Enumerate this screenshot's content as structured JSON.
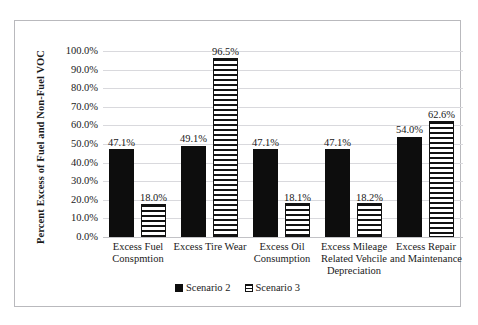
{
  "chart_data": {
    "type": "bar",
    "title": "",
    "xlabel": "",
    "ylabel": "Percent Excess of Fuel and Non-Fuel VOC",
    "ylim": [
      0,
      100
    ],
    "ytick_labels": [
      "100.0%",
      "90.0%",
      "80.0%",
      "70.0%",
      "60.0%",
      "50.0%",
      "40.0%",
      "30.0%",
      "20.0%",
      "10.0%",
      "0.0%"
    ],
    "ytick_values": [
      100,
      90,
      80,
      70,
      60,
      50,
      40,
      30,
      20,
      10,
      0
    ],
    "grid": true,
    "legend_position": "bottom",
    "categories": [
      "Excess Fuel Conspmtion",
      "Excess Tire Wear",
      "Excess Oil Consumption",
      "Excess Mileage Related Vehcile Depreciation",
      "Excess Repair and Maintenance"
    ],
    "series": [
      {
        "name": "Scenario 2",
        "color": "#0d0d0d",
        "pattern": "solid",
        "values": [
          47.1,
          49.1,
          47.1,
          47.1,
          54.0
        ],
        "labels": [
          "47.1%",
          "49.1%",
          "47.1%",
          "47.1%",
          "54.0%"
        ]
      },
      {
        "name": "Scenario 3",
        "color": "#111111",
        "pattern": "horizontal-stripes",
        "values": [
          18.0,
          96.5,
          18.1,
          18.2,
          62.6
        ],
        "labels": [
          "18.0%",
          "96.5%",
          "18.1%",
          "18.2%",
          "62.6%"
        ]
      }
    ]
  },
  "legend": {
    "items": [
      {
        "label": "Scenario 2",
        "swatch": "solid-black-square-icon"
      },
      {
        "label": "Scenario 3",
        "swatch": "striped-square-icon"
      }
    ]
  }
}
